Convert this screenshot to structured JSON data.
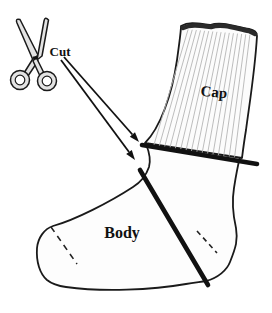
{
  "diagram": {
    "type": "sock-cutting-instruction-diagram",
    "labels": {
      "cut": "Cut",
      "cap": "Cap",
      "body": "Body"
    },
    "icons": {
      "scissors": "scissors-icon"
    },
    "colors": {
      "background": "#ffffff",
      "outline": "#1a1a1a",
      "sock_fill": "#fdfdfd",
      "rib_line": "#b5b5b5",
      "cuff_band": "#2a2a2a",
      "cut_line": "#111111",
      "scissors_fill": "#e3e3e3"
    }
  }
}
